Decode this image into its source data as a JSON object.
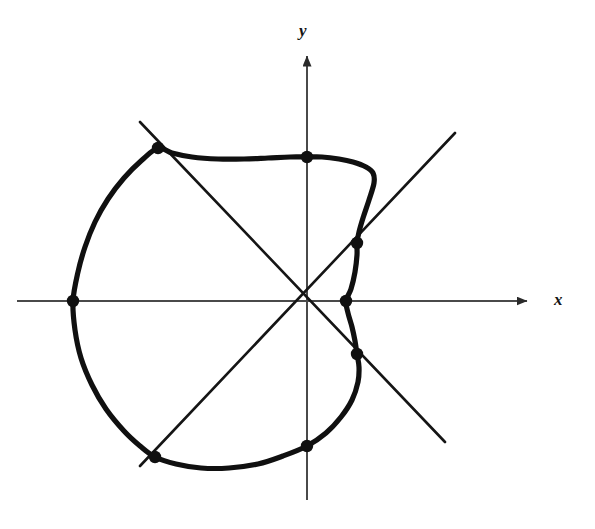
{
  "figure": {
    "title": "",
    "background_color": "#ffffff",
    "width": 595,
    "height": 529,
    "axis_color": "#4a4a4a",
    "curve_color": "#101010",
    "line_color": "#151515",
    "point_color": "#101010"
  },
  "axes": {
    "x_label": "x",
    "y_label": "y",
    "origin_px": [
      307,
      301
    ],
    "x_axis": {
      "start_px": [
        17,
        301
      ],
      "end_px": [
        531,
        301
      ],
      "arrow": "right"
    },
    "y_axis": {
      "start_px": [
        307,
        500
      ],
      "end_px": [
        307,
        52
      ],
      "arrow": "up"
    }
  },
  "lines": [
    {
      "name": "diagonal-line-45",
      "angle_deg": 45,
      "start_px": [
        140,
        466
      ],
      "end_px": [
        455,
        133
      ]
    },
    {
      "name": "diagonal-line-135",
      "angle_deg": 135,
      "start_px": [
        140,
        122
      ],
      "end_px": [
        445,
        442
      ]
    }
  ],
  "chart_data": {
    "type": "line",
    "title": "",
    "xlabel": "x",
    "ylabel": "y",
    "grid": false,
    "legend": null,
    "coordinate_system": "polar",
    "curve": {
      "name": "limacon-curve",
      "closed": true,
      "points_px": [
        [
          346,
          301
        ],
        [
          351,
          289
        ],
        [
          355,
          272
        ],
        [
          357,
          255
        ],
        [
          357,
          243
        ],
        [
          359,
          232
        ],
        [
          363,
          218
        ],
        [
          369,
          200
        ],
        [
          374,
          183
        ],
        [
          373,
          173
        ],
        [
          366,
          167
        ],
        [
          353,
          162
        ],
        [
          339,
          159
        ],
        [
          322,
          157
        ],
        [
          307,
          157
        ],
        [
          290,
          157
        ],
        [
          268,
          158
        ],
        [
          244,
          159
        ],
        [
          218,
          159
        ],
        [
          192,
          157
        ],
        [
          172,
          153
        ],
        [
          158,
          148
        ],
        [
          142,
          160
        ],
        [
          124,
          178
        ],
        [
          108,
          199
        ],
        [
          95,
          222
        ],
        [
          85,
          247
        ],
        [
          78,
          272
        ],
        [
          73,
          301
        ],
        [
          75,
          330
        ],
        [
          81,
          358
        ],
        [
          92,
          385
        ],
        [
          106,
          409
        ],
        [
          124,
          431
        ],
        [
          140,
          446
        ],
        [
          155,
          457
        ],
        [
          176,
          464
        ],
        [
          201,
          468
        ],
        [
          229,
          468
        ],
        [
          258,
          464
        ],
        [
          283,
          456
        ],
        [
          307,
          446
        ],
        [
          326,
          433
        ],
        [
          341,
          417
        ],
        [
          352,
          400
        ],
        [
          358,
          382
        ],
        [
          359,
          367
        ],
        [
          357,
          354
        ],
        [
          355,
          341
        ],
        [
          352,
          327
        ],
        [
          348,
          313
        ],
        [
          346,
          301
        ]
      ]
    },
    "marked_points": [
      {
        "name": "point-x-axis-right",
        "px": [
          346,
          301
        ],
        "on": [
          "curve",
          "x-axis"
        ],
        "polar_angle_deg": 0
      },
      {
        "name": "point-diag45-upper-right",
        "px": [
          357,
          243
        ],
        "on": [
          "curve",
          "diagonal-line-45"
        ],
        "polar_angle_deg": 45
      },
      {
        "name": "point-y-axis-top",
        "px": [
          307,
          157
        ],
        "on": [
          "curve",
          "y-axis"
        ],
        "polar_angle_deg": 90
      },
      {
        "name": "point-diag135-upper-left",
        "px": [
          158,
          148
        ],
        "on": [
          "curve",
          "diagonal-line-135"
        ],
        "polar_angle_deg": 135
      },
      {
        "name": "point-x-axis-left",
        "px": [
          73,
          301
        ],
        "on": [
          "curve",
          "x-axis"
        ],
        "polar_angle_deg": 180
      },
      {
        "name": "point-diag45-lower-left",
        "px": [
          155,
          457
        ],
        "on": [
          "curve",
          "diagonal-line-45"
        ],
        "polar_angle_deg": 225
      },
      {
        "name": "point-y-axis-bottom",
        "px": [
          307,
          446
        ],
        "on": [
          "curve",
          "y-axis"
        ],
        "polar_angle_deg": 270
      },
      {
        "name": "point-diag135-lower-right",
        "px": [
          357,
          354
        ],
        "on": [
          "curve",
          "diagonal-line-135"
        ],
        "polar_angle_deg": 315
      }
    ]
  }
}
